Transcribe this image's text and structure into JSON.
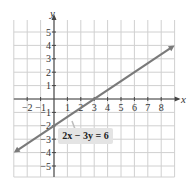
{
  "chart_data": {
    "type": "line",
    "title": "",
    "xlabel": "x",
    "ylabel": "y",
    "xlim": [
      -3,
      9
    ],
    "ylim": [
      -6,
      6
    ],
    "grid": true,
    "x_ticks": [
      -2,
      -1,
      1,
      2,
      3,
      4,
      5,
      6,
      7,
      8
    ],
    "y_ticks": [
      5,
      4,
      3,
      2,
      1,
      -1,
      -2,
      -3,
      -4,
      -5
    ],
    "x_tick_labels": [
      "−2",
      "−1",
      "1",
      "2",
      "3",
      "4",
      "5",
      "6",
      "7",
      "8"
    ],
    "y_tick_labels": [
      "5",
      "4",
      "3",
      "2",
      "1",
      "−1",
      "−2",
      "−3",
      "−4",
      "−5"
    ],
    "series": [
      {
        "name": "2x − 3y = 6",
        "equation": "2x - 3y = 6",
        "slope": 0.6667,
        "y_intercept": -2,
        "x_intercept": 3,
        "x": [
          -3,
          0,
          3,
          9
        ],
        "y": [
          -4,
          -2,
          0,
          4
        ],
        "color": "#7a7a7a",
        "arrows": "both"
      }
    ],
    "annotations": [
      {
        "text": "2x − 3y = 6",
        "points_to": [
          1.3,
          -1.1
        ]
      }
    ]
  },
  "labels": {
    "x_axis": "x",
    "y_axis": "y",
    "equation": "2x − 3y = 6"
  },
  "colors": {
    "grid": "#d0d0d0",
    "axis": "#444444",
    "line": "#7a7a7a",
    "label_bg": "#e4e4e4"
  }
}
